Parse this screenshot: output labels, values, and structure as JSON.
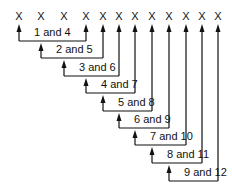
{
  "diagram": {
    "marks": [
      "X",
      "X",
      "X",
      "X",
      "X",
      "X",
      "X",
      "X",
      "X",
      "X",
      "X",
      "X"
    ],
    "mark_x": [
      19,
      41,
      64,
      86,
      103,
      119,
      135,
      152,
      169,
      186,
      202,
      218
    ],
    "mark_y": 11,
    "arrow_top": 24,
    "pairs": [
      {
        "label": "1 and 4",
        "from": 1,
        "to": 4,
        "line_y": 41
      },
      {
        "label": "2 and 5",
        "from": 2,
        "to": 5,
        "line_y": 58
      },
      {
        "label": "3 and 6",
        "from": 3,
        "to": 6,
        "line_y": 76
      },
      {
        "label": "4 and 7",
        "from": 4,
        "to": 7,
        "line_y": 93
      },
      {
        "label": "5 and 8",
        "from": 5,
        "to": 8,
        "line_y": 111
      },
      {
        "label": "6 and 9",
        "from": 6,
        "to": 9,
        "line_y": 128
      },
      {
        "label": "7 and 10",
        "from": 7,
        "to": 10,
        "line_y": 145
      },
      {
        "label": "8 and 11",
        "from": 8,
        "to": 11,
        "line_y": 163
      },
      {
        "label": "9 and 12",
        "from": 9,
        "to": 12,
        "line_y": 181
      }
    ],
    "line_color": "#111111"
  }
}
